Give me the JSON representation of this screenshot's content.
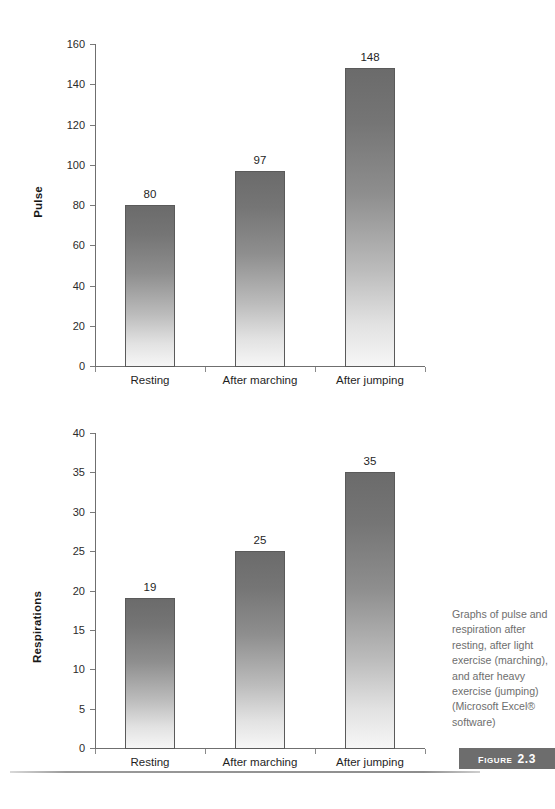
{
  "figure": {
    "badge_word": "Figure",
    "badge_number": "2.3",
    "caption_lines": [
      "Graphs of pulse and",
      "respiration after",
      "resting, after light",
      "exercise (marching),",
      "and after heavy",
      "exercise (jumping)",
      "(Microsoft Excel®",
      "software)"
    ],
    "caption_text": "Graphs of pulse and respiration after resting, after light exercise (marching), and after heavy exercise (jumping) (Microsoft Excel® software)"
  },
  "colors": {
    "bar_top": "#6b6b6b",
    "bar_bottom": "#f6f6f6",
    "bar_outline": "#5a5a5a",
    "axis": "#6f6f6f",
    "badge_bg": "#6d6d6d",
    "caption_text": "#6e6e6e",
    "label_text": "#1f1f1f"
  },
  "chart_data": [
    {
      "type": "bar",
      "id": "pulse-chart",
      "title": "",
      "xlabel": "",
      "ylabel": "Pulse",
      "categories": [
        "Resting",
        "After marching",
        "After jumping"
      ],
      "values": [
        80,
        97,
        148
      ],
      "value_labels": [
        "80",
        "97",
        "148"
      ],
      "ylim": [
        0,
        160
      ],
      "yticks": [
        0,
        20,
        40,
        60,
        80,
        100,
        120,
        140,
        160
      ],
      "ytick_labels": [
        "0",
        "20",
        "40",
        "60",
        "80",
        "100",
        "120",
        "140",
        "160"
      ],
      "grid": false,
      "legend": "none"
    },
    {
      "type": "bar",
      "id": "respirations-chart",
      "title": "",
      "xlabel": "",
      "ylabel": "Respirations",
      "categories": [
        "Resting",
        "After marching",
        "After jumping"
      ],
      "values": [
        19,
        25,
        35
      ],
      "value_labels": [
        "19",
        "25",
        "35"
      ],
      "ylim": [
        0,
        40
      ],
      "yticks": [
        0,
        5,
        10,
        15,
        20,
        25,
        30,
        35,
        40
      ],
      "ytick_labels": [
        "0",
        "5",
        "10",
        "15",
        "20",
        "25",
        "30",
        "35",
        "40"
      ],
      "grid": false,
      "legend": "none"
    }
  ]
}
